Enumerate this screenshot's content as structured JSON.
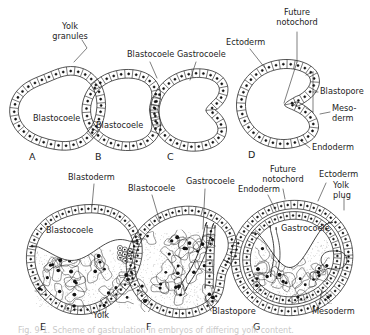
{
  "figure": {
    "caption_partial": "Fig. 9-1. Scheme of gastrulation in embryos of differing yolk content.",
    "panels": [
      {
        "id": "A",
        "label": "A",
        "row": "top",
        "stage": "blastula",
        "description": "Rounded blastula with single layer of cells surrounding a large blastocoele",
        "labels": [
          "Blastocoele",
          "Yolk granules"
        ]
      },
      {
        "id": "B",
        "label": "B",
        "row": "top",
        "stage": "early invagination",
        "description": "Blastula beginning to invaginate at the vegetal pole",
        "labels": [
          "Blastocoele"
        ]
      },
      {
        "id": "C",
        "label": "C",
        "row": "top",
        "stage": "mid gastrula",
        "description": "Deeper invagination forming the gastrocoele, blastocoele reduced",
        "labels": [
          "Blastocoele",
          "Gastrocoele"
        ]
      },
      {
        "id": "D",
        "label": "D",
        "row": "top",
        "stage": "late gastrula",
        "description": "Two-layered gastrula with gastrocoele, blastopore and germ layers",
        "labels": [
          "Ectoderm",
          "Gastrocoele",
          "Future notochord",
          "Blastopore",
          "Meso-derm",
          "Endoderm"
        ]
      },
      {
        "id": "E",
        "label": "E",
        "row": "bottom",
        "stage": "yolk-laden blastula",
        "description": "Blastoderm cap of small cells over a large mass of yolk-laden cells",
        "labels": [
          "Blastoderm",
          "Blastocoele",
          "Yolk"
        ]
      },
      {
        "id": "F",
        "label": "F",
        "row": "bottom",
        "stage": "yolk-laden gastrula",
        "description": "Invagination over the yolk mass forming the gastrocoele and blastopore",
        "labels": [
          "Blastocoele",
          "Gastrocoele",
          "Blastopore"
        ]
      },
      {
        "id": "G",
        "label": "G",
        "row": "bottom",
        "stage": "late yolk-laden gastrula",
        "description": "Yolk plug in the blastopore, gastrocoele enclosed, three germ layers present",
        "labels": [
          "Endoderm",
          "Future notochord",
          "Ectoderm",
          "Yolk plug",
          "Gastrocoele",
          "Mesoderm"
        ]
      }
    ],
    "annotations": [
      {
        "id": "a-yolk-granules",
        "text": "Yolk granules",
        "lines": [
          "Yolk",
          "granules"
        ],
        "x": 70,
        "y": 29,
        "anchor": "middle",
        "panel": "A"
      },
      {
        "id": "a-blastocoele",
        "text": "Blastocoele",
        "lines": [
          "Blastocoele"
        ],
        "x": 33,
        "y": 121,
        "anchor": "start",
        "panel": "A"
      },
      {
        "id": "b-blastocoele",
        "text": "Blastocoele",
        "lines": [
          "Blastocoele"
        ],
        "x": 96,
        "y": 128,
        "anchor": "start",
        "panel": "B"
      },
      {
        "id": "c-blastocoele",
        "text": "Blastocoele",
        "lines": [
          "Blastocoele"
        ],
        "x": 127,
        "y": 57,
        "anchor": "start",
        "panel": "C"
      },
      {
        "id": "c-gastrocoele",
        "text": "Gastrocoele",
        "lines": [
          "Gastrocoele"
        ],
        "x": 177,
        "y": 57,
        "anchor": "start",
        "panel": "C"
      },
      {
        "id": "d-ectoderm",
        "text": "Ectoderm",
        "lines": [
          "Ectoderm"
        ],
        "x": 226,
        "y": 45,
        "anchor": "start",
        "panel": "D"
      },
      {
        "id": "d-future-notochord",
        "text": "Future notochord",
        "lines": [
          "Future",
          "notochord"
        ],
        "x": 297,
        "y": 15,
        "anchor": "middle",
        "panel": "D"
      },
      {
        "id": "d-blastopore",
        "text": "Blastopore",
        "lines": [
          "Blastopore"
        ],
        "x": 320,
        "y": 94,
        "anchor": "start",
        "panel": "D"
      },
      {
        "id": "d-mesoderm",
        "text": "Meso-derm",
        "lines": [
          "Meso-",
          "derm"
        ],
        "x": 332,
        "y": 111,
        "anchor": "start",
        "panel": "D"
      },
      {
        "id": "d-endoderm",
        "text": "Endoderm",
        "lines": [
          "Endoderm"
        ],
        "x": 312,
        "y": 150,
        "anchor": "start",
        "panel": "D"
      },
      {
        "id": "e-blastoderm",
        "text": "Blastoderm",
        "lines": [
          "Blastoderm"
        ],
        "x": 68,
        "y": 180,
        "anchor": "start",
        "panel": "E"
      },
      {
        "id": "e-blastocoele",
        "text": "Blastocoele",
        "lines": [
          "Blastocoele"
        ],
        "x": 46,
        "y": 233,
        "anchor": "start",
        "panel": "E"
      },
      {
        "id": "e-yolk",
        "text": "Yolk",
        "lines": [
          "Yolk"
        ],
        "x": 93,
        "y": 318,
        "anchor": "start",
        "panel": "E"
      },
      {
        "id": "f-blastocoele",
        "text": "Blastocoele",
        "lines": [
          "Blastocoele"
        ],
        "x": 128,
        "y": 191,
        "anchor": "start",
        "panel": "F"
      },
      {
        "id": "f-gastrocoele",
        "text": "Gastrocoele",
        "lines": [
          "Gastrocoele"
        ],
        "x": 186,
        "y": 184,
        "anchor": "start",
        "panel": "F"
      },
      {
        "id": "f-blastopore",
        "text": "Blastopore",
        "lines": [
          "Blastopore"
        ],
        "x": 212,
        "y": 314,
        "anchor": "start",
        "panel": "F"
      },
      {
        "id": "g-endoderm",
        "text": "Endoderm",
        "lines": [
          "Endoderm"
        ],
        "x": 238,
        "y": 192,
        "anchor": "start",
        "panel": "G"
      },
      {
        "id": "g-future-notochord",
        "text": "Future notochord",
        "lines": [
          "Future",
          "notochord"
        ],
        "x": 283,
        "y": 172,
        "anchor": "middle",
        "panel": "G"
      },
      {
        "id": "g-ectoderm",
        "text": "Ectoderm",
        "lines": [
          "Ectoderm"
        ],
        "x": 319,
        "y": 177,
        "anchor": "start",
        "panel": "G"
      },
      {
        "id": "g-yolk-plug",
        "text": "Yolk plug",
        "lines": [
          "Yolk",
          "plug"
        ],
        "x": 333,
        "y": 188,
        "anchor": "start",
        "panel": "G"
      },
      {
        "id": "g-gastrocoele",
        "text": "Gastrocoele",
        "lines": [
          "Gastrocoele"
        ],
        "x": 281,
        "y": 231,
        "anchor": "start",
        "panel": "G"
      },
      {
        "id": "g-mesoderm",
        "text": "Mesoderm",
        "lines": [
          "Mesoderm"
        ],
        "x": 312,
        "y": 314,
        "anchor": "start",
        "panel": "G"
      }
    ],
    "panel_letters": [
      {
        "id": "A",
        "label": "A",
        "x": 29,
        "y": 160
      },
      {
        "id": "B",
        "label": "B",
        "x": 95,
        "y": 160
      },
      {
        "id": "C",
        "label": "C",
        "x": 167,
        "y": 160
      },
      {
        "id": "D",
        "label": "D",
        "x": 248,
        "y": 158
      },
      {
        "id": "E",
        "label": "E",
        "x": 40,
        "y": 330
      },
      {
        "id": "F",
        "label": "F",
        "x": 146,
        "y": 330
      },
      {
        "id": "G",
        "label": "G",
        "x": 253,
        "y": 330
      }
    ],
    "colors": {
      "ink": "#1d1d1d",
      "leader": "#2a2a2a",
      "background": "#ffffff",
      "nucleus": "#111111",
      "yolk_stipple": "#5a5a5a",
      "caption_faded": "#c9c9c9"
    }
  }
}
